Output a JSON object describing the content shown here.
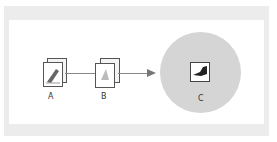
{
  "diagram": {
    "nodes": [
      {
        "id": "A",
        "label": "A",
        "icon": "file-with-brush-icon"
      },
      {
        "id": "B",
        "label": "B",
        "icon": "stacked-documents-icon"
      },
      {
        "id": "C",
        "label": "C",
        "icon": "application-brush-icon"
      }
    ],
    "edges": [
      {
        "from": "A",
        "to": "B",
        "style": "line"
      },
      {
        "from": "B",
        "to": "C",
        "style": "arrow"
      }
    ],
    "colors": {
      "frame": "#ececec",
      "circle": "#d5d5d5",
      "line": "#888888"
    }
  }
}
